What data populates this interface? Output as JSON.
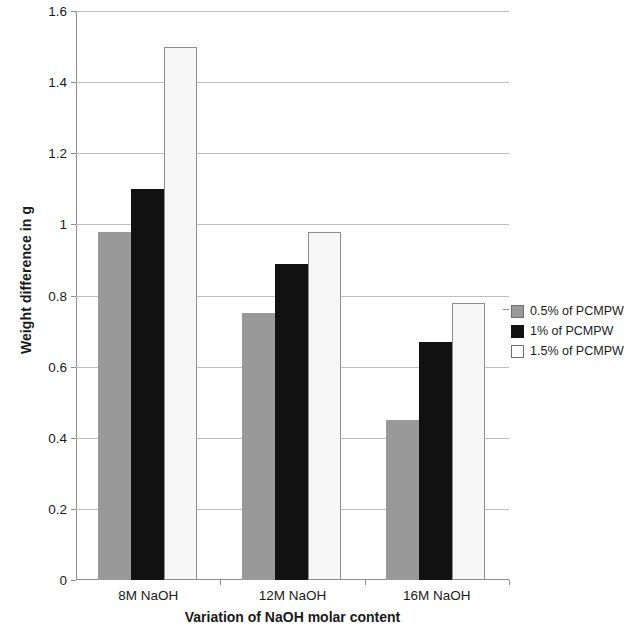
{
  "chart_data": {
    "type": "bar",
    "title": "",
    "xlabel": "Variation of NaOH molar content",
    "ylabel": "Weight difference in g",
    "categories": [
      "8M NaOH",
      "12M NaOH",
      "16M NaOH"
    ],
    "series": [
      {
        "name": "0.5% of PCMPW",
        "color": "#999999",
        "values": [
          0.98,
          0.75,
          0.45
        ]
      },
      {
        "name": "1% of PCMPW",
        "color": "#111111",
        "values": [
          1.1,
          0.89,
          0.67
        ]
      },
      {
        "name": "1.5% of PCMPW",
        "color": "#f7f7f7",
        "values": [
          1.5,
          0.98,
          0.78
        ]
      }
    ],
    "ylim": [
      0,
      1.6
    ],
    "ytick_labels": [
      "1.6",
      "1.4",
      "1.2",
      "1",
      "0.8",
      "0.6",
      "0.4",
      "0.2",
      "0"
    ],
    "ytick_values": [
      1.6,
      1.4,
      1.2,
      1.0,
      0.8,
      0.6,
      0.4,
      0.2,
      0
    ],
    "grid": true,
    "legend_position": "right"
  }
}
